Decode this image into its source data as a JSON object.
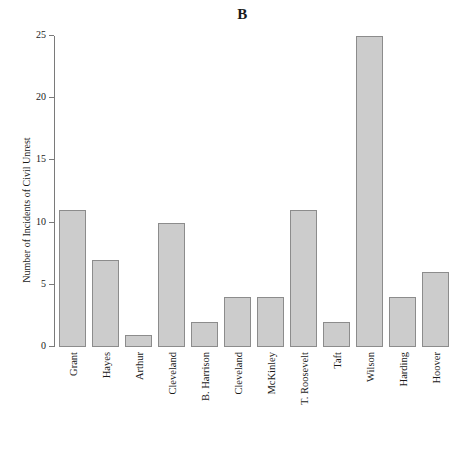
{
  "chart_data": {
    "type": "bar",
    "title": "B",
    "xlabel": "",
    "ylabel": "Number of Incidents of Civil Unrest",
    "categories": [
      "Grant",
      "Hayes",
      "Arthur",
      "Cleveland",
      "B. Harrison",
      "Cleveland",
      "McKinley",
      "T. Roosevelt",
      "Taft",
      "Wilson",
      "Harding",
      "Hoover"
    ],
    "values": [
      11,
      7,
      1,
      10,
      2,
      4,
      4,
      11,
      2,
      25,
      4,
      6
    ],
    "ylim": [
      0,
      25
    ],
    "yticks": [
      0,
      5,
      10,
      15,
      20,
      25
    ],
    "ytick_labels": [
      "0",
      "5",
      "10",
      "15",
      "20",
      "25"
    ],
    "grid": false,
    "legend": false,
    "bar_fill_color": "#cccccc",
    "bar_edge_color": "#8c8c8c",
    "axis_color": "#7a7a7a",
    "background_color": "#ffffff"
  }
}
